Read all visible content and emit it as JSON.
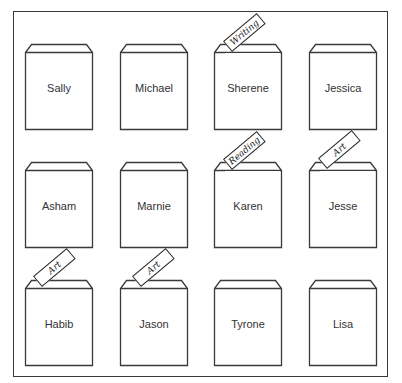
{
  "diagram": {
    "colors": {
      "line": "#3a3a3a",
      "text": "#333333",
      "background": "#ffffff"
    },
    "rows": [
      {
        "pockets": [
          {
            "name": "Sally",
            "card": null
          },
          {
            "name": "Michael",
            "card": null
          },
          {
            "name": "Sherene",
            "card": "Writing"
          },
          {
            "name": "Jessica",
            "card": null
          }
        ]
      },
      {
        "pockets": [
          {
            "name": "Asham",
            "card": null
          },
          {
            "name": "Marnie",
            "card": null
          },
          {
            "name": "Karen",
            "card": "Reading"
          },
          {
            "name": "Jesse",
            "card": "Art"
          }
        ]
      },
      {
        "pockets": [
          {
            "name": "Habib",
            "card": "Art"
          },
          {
            "name": "Jason",
            "card": "Art"
          },
          {
            "name": "Tyrone",
            "card": null
          },
          {
            "name": "Lisa",
            "card": null
          }
        ]
      }
    ]
  }
}
